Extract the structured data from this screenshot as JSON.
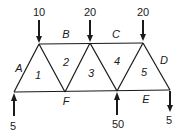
{
  "diagram": {
    "type": "truss-bows-notation",
    "loads_top": [
      {
        "label": "10",
        "x": 39
      },
      {
        "label": "20",
        "x": 90
      },
      {
        "label": "20",
        "x": 143
      }
    ],
    "reactions_bottom": [
      {
        "label": "5",
        "x": 14,
        "direction": "up"
      },
      {
        "label": "50",
        "x": 117,
        "direction": "up"
      },
      {
        "label": "5",
        "x": 170,
        "direction": "down"
      }
    ],
    "space_labels": {
      "A": "A",
      "B": "B",
      "C": "C",
      "D": "D",
      "E": "E",
      "F": "F"
    },
    "panel_labels": [
      "1",
      "2",
      "3",
      "4",
      "5"
    ],
    "line_color": "#1a1a1a"
  }
}
